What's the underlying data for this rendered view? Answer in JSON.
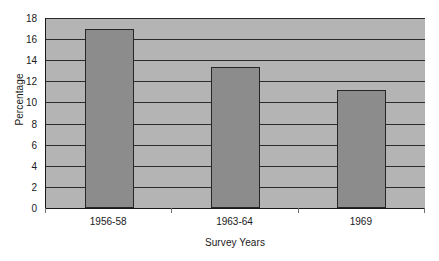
{
  "chart_data": {
    "type": "bar",
    "title": "",
    "subtitle": "",
    "xlabel": "Survey Years",
    "ylabel": "Percentage",
    "categories": [
      "1956-58",
      "1963-64",
      "1969"
    ],
    "values": [
      17.0,
      13.4,
      11.2
    ],
    "series": [
      {
        "name": "Percentage",
        "values": [
          17.0,
          13.4,
          11.2
        ]
      }
    ],
    "ylim": [
      0,
      18
    ],
    "xlim": [
      0,
      3
    ],
    "y_ticks": [
      0,
      2,
      4,
      6,
      8,
      10,
      12,
      14,
      16,
      18
    ],
    "y_tick_labels": [
      "0",
      "2",
      "4",
      "6",
      "8",
      "10",
      "12",
      "14",
      "16",
      "18"
    ],
    "grid": "horizontal",
    "legend": "none",
    "annotations": [],
    "colors": {
      "bar_fill": "#8c8c8c",
      "bar_edge": "#262626",
      "plot_background": "#b4b4b4",
      "gridline": "#2b2b2b",
      "axis": "#1a1a1a",
      "text": "#1a1a1a",
      "page_background": "#ffffff"
    }
  }
}
